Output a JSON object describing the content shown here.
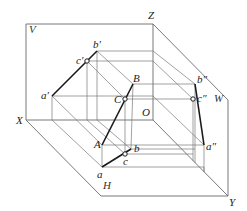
{
  "diagram": {
    "title": "",
    "planes": {
      "V": "V",
      "H": "H",
      "W": "W"
    },
    "axes": {
      "X": "X",
      "Y": "Y",
      "Z": "Z",
      "O": "O"
    },
    "space_points": {
      "A": "A",
      "B": "B",
      "C": "C"
    },
    "v_projections": {
      "a": "a′",
      "b": "b′",
      "c": "c′"
    },
    "h_projections": {
      "a": "a",
      "b": "b",
      "c": "c"
    },
    "w_projections": {
      "a": "a″",
      "b": "b″",
      "c": "c″"
    },
    "colors": {
      "frame": "#6a6a6a",
      "projection_lines": "#7a7a7a",
      "segment": "#1a1a1a",
      "background": "#ffffff"
    }
  }
}
